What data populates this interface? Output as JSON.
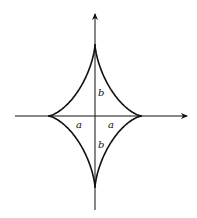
{
  "diagram": {
    "type": "astroid",
    "colors": {
      "stroke": "#111111",
      "background": "#ffffff"
    },
    "center": [
      95,
      116
    ],
    "semi_axes": {
      "a_px": 47,
      "b_px": 72
    },
    "labels": {
      "b_upper": "b",
      "b_lower": "b",
      "a_left": "a",
      "a_right": "a"
    },
    "axes": {
      "horizontal": {
        "from": [
          15,
          116
        ],
        "to": [
          188,
          116
        ],
        "arrow": "right"
      },
      "vertical": {
        "from": [
          95,
          210
        ],
        "to": [
          95,
          12
        ],
        "arrow": "up"
      }
    }
  }
}
